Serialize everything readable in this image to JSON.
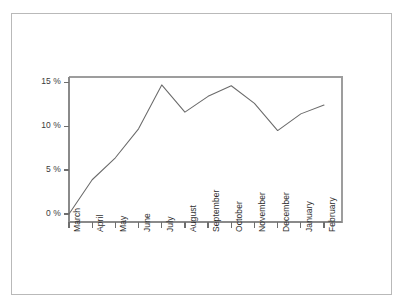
{
  "chart_data": {
    "type": "line",
    "title": "",
    "subtitle": "",
    "xlabel": "",
    "ylabel": "",
    "categories": [
      "March",
      "April",
      "May",
      "June",
      "July",
      "August",
      "September",
      "October",
      "November",
      "December",
      "January",
      "February"
    ],
    "values": [
      0.0,
      3.9,
      6.4,
      9.7,
      14.7,
      11.6,
      13.4,
      14.6,
      12.6,
      9.5,
      11.4,
      12.4
    ],
    "series": [
      {
        "name": "",
        "values": [
          0.0,
          3.9,
          6.4,
          9.7,
          14.7,
          11.6,
          13.4,
          14.6,
          12.6,
          9.5,
          11.4,
          12.4
        ]
      }
    ],
    "ylim": [
      0,
      15.6
    ],
    "ytick_values": [
      0,
      5,
      10,
      15
    ],
    "ytick_labels": [
      "0 %",
      "5 %",
      "10 %",
      "15 %"
    ],
    "grid": false,
    "legend": false,
    "legend_position": "none",
    "line_color": "#6a6a6a",
    "axis_color": "#8a8a8a",
    "frame_color": "#b9b9b9",
    "background_color": "#ffffff",
    "annotations": []
  }
}
